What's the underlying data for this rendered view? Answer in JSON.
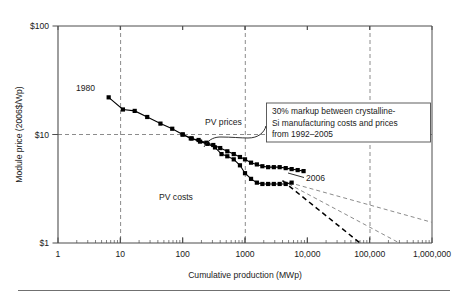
{
  "chart_data": {
    "type": "line",
    "title": "",
    "xlabel": "Cumulative production (MWp)",
    "ylabel": "Module price (2006$/Wp)",
    "xscale": "log",
    "yscale": "log",
    "xlim": [
      1,
      1000000
    ],
    "ylim": [
      1,
      100
    ],
    "xticklabels": [
      "1",
      "10",
      "100",
      "1000",
      "10,000",
      "100,000",
      "1,000,000"
    ],
    "xtickvalues": [
      1,
      10,
      100,
      1000,
      10000,
      100000,
      1000000
    ],
    "yticklabels": [
      "$1",
      "$10",
      "$100"
    ],
    "ytickvalues": [
      1,
      10,
      100
    ],
    "grid": "dashed gridlines at x=10, x=1000, x=100,000 and y=$10",
    "legend_position": "inline labels on curves",
    "series": [
      {
        "name": "PV prices",
        "label": "PV prices",
        "marker": "filled square",
        "color": "#000000",
        "points": [
          [
            6.5,
            22.0
          ],
          [
            11.0,
            17.0
          ],
          [
            17.0,
            16.5
          ],
          [
            27.0,
            14.5
          ],
          [
            44.0,
            12.6
          ],
          [
            68.0,
            11.3
          ],
          [
            100.0,
            10.0
          ],
          [
            135.0,
            9.2
          ],
          [
            180.0,
            8.9
          ],
          [
            240.0,
            8.4
          ],
          [
            310.0,
            8.0
          ],
          [
            400.0,
            7.5
          ],
          [
            520.0,
            7.0
          ],
          [
            660.0,
            6.6
          ],
          [
            830.0,
            6.2
          ],
          [
            1000.0,
            5.9
          ],
          [
            1250.0,
            5.5
          ],
          [
            1550.0,
            5.3
          ],
          [
            1900.0,
            5.1
          ],
          [
            2350.0,
            5.0
          ],
          [
            2900.0,
            5.0
          ],
          [
            3600.0,
            5.0
          ],
          [
            4500.0,
            4.9
          ],
          [
            5600.0,
            4.8
          ],
          [
            7000.0,
            4.7
          ],
          [
            8700.0,
            4.6
          ]
        ]
      },
      {
        "name": "PV costs",
        "label": "PV costs",
        "marker": "filled square",
        "color": "#000000",
        "points": [
          [
            100.0,
            10.0
          ],
          [
            140.0,
            9.2
          ],
          [
            190.0,
            8.6
          ],
          [
            250.0,
            8.2
          ],
          [
            330.0,
            7.6
          ],
          [
            420.0,
            6.6
          ],
          [
            520.0,
            6.3
          ],
          [
            660.0,
            5.9
          ],
          [
            830.0,
            5.2
          ],
          [
            1000.0,
            4.4
          ],
          [
            1250.0,
            3.9
          ],
          [
            1550.0,
            3.6
          ],
          [
            1900.0,
            3.5
          ],
          [
            2350.0,
            3.5
          ],
          [
            2900.0,
            3.5
          ],
          [
            3600.0,
            3.5
          ],
          [
            4500.0,
            3.5
          ],
          [
            5600.0,
            3.6
          ]
        ]
      },
      {
        "name": "experience-curve fit",
        "label": "",
        "marker": "none",
        "color": "#000000",
        "points": [
          [
            6.5,
            21.0
          ],
          [
            4000.0,
            3.75
          ]
        ]
      }
    ],
    "projections": [
      {
        "name": "projection-shallow",
        "points": [
          [
            4000,
            3.75
          ],
          [
            1000000,
            1.55
          ]
        ],
        "style": "dashed",
        "color": "#8c8c8c"
      },
      {
        "name": "projection-medium",
        "points": [
          [
            4000,
            3.75
          ],
          [
            300000,
            1.0
          ]
        ],
        "style": "dashed",
        "color": "#8c8c8c"
      },
      {
        "name": "projection-steep",
        "points": [
          [
            4000,
            3.75
          ],
          [
            70000,
            1.0
          ]
        ],
        "style": "dashed",
        "color": "#000000"
      }
    ],
    "annotations": [
      {
        "name": "year-start",
        "text": "1980",
        "x": 4.2,
        "y": 34.0
      },
      {
        "name": "year-end",
        "text": "2006",
        "x": 16000,
        "y": 5.1
      },
      {
        "name": "series-label-prices",
        "text": "PV prices",
        "x": 330,
        "y": 15.0
      },
      {
        "name": "series-label-costs",
        "text": "PV costs",
        "x": 420,
        "y": 2.6
      }
    ],
    "callout": {
      "name": "markup-callout",
      "lines": [
        "30% markup between crystalline-",
        "Si manufacturing costs and prices",
        "from 1992–2005"
      ],
      "full_text": "30% markup between crystalline-Si manufacturing costs and prices from 1992–2005"
    }
  },
  "colors": {
    "plot_frame": "#4d4d4d",
    "gridline": "#8c8c8c",
    "data": "#000000",
    "projection_gray": "#8c8c8c",
    "projection_black": "#000000",
    "callout_border": "#4d4d4d",
    "rule": "#707070",
    "background": "#ffffff"
  }
}
